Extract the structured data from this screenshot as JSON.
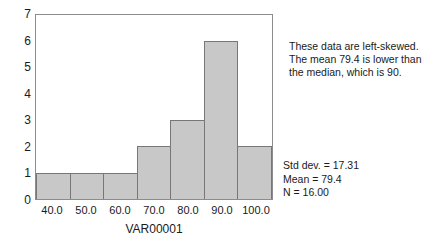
{
  "chart_data": {
    "type": "bar",
    "title": "",
    "xlabel": "VAR00001",
    "ylabel": "",
    "categories": [
      "40.0",
      "50.0",
      "60.0",
      "70.0",
      "80.0",
      "90.0",
      "100.0"
    ],
    "values": [
      1,
      1,
      1,
      2,
      3,
      6,
      2
    ],
    "ylim": [
      0,
      7
    ],
    "y_ticks": [
      "0",
      "1",
      "2",
      "3",
      "4",
      "5",
      "6",
      "7"
    ],
    "grid": false,
    "legend": "none",
    "bar_fill_color": "#c8c8c8",
    "bar_border_color": "#777777",
    "frame_color": "#8c8c8c"
  },
  "annotations": {
    "note_lines": [
      "These data are left-skewed.",
      "The mean 79.4 is lower than",
      "the median, which is 90."
    ],
    "stats_lines": [
      "Std dev. = 17.31",
      "Mean = 79.4",
      "N = 16.00"
    ]
  }
}
